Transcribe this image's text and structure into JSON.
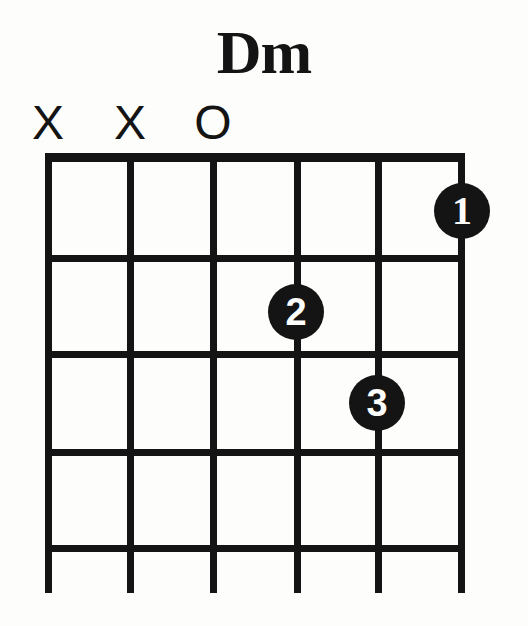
{
  "diagram": {
    "title": "Dm",
    "instrument": "guitar",
    "type": "chord-diagram",
    "accent_color": "#141414",
    "background_color": "#fdfdfc",
    "fret_count": 4,
    "string_count": 6,
    "starting_fret": 1,
    "string_markers": [
      {
        "string": 1,
        "symbol": "X",
        "meaning": "muted",
        "x": 48
      },
      {
        "string": 2,
        "symbol": "X",
        "meaning": "muted",
        "x": 130
      },
      {
        "string": 3,
        "symbol": "O",
        "meaning": "open",
        "x": 213
      }
    ],
    "strings": [
      {
        "index": 1,
        "x": 48
      },
      {
        "index": 2,
        "x": 130
      },
      {
        "index": 3,
        "x": 213
      },
      {
        "index": 4,
        "x": 297
      },
      {
        "index": 5,
        "x": 378
      },
      {
        "index": 6,
        "x": 462
      }
    ],
    "nut": {
      "x": 45,
      "y": 153,
      "width": 420,
      "height": 9
    },
    "fret_lines": [
      {
        "fret": 1,
        "y": 258
      },
      {
        "fret": 2,
        "y": 354
      },
      {
        "fret": 3,
        "y": 452
      },
      {
        "fret": 4,
        "y": 548
      }
    ],
    "string_extent": {
      "top": 153,
      "bottom": 593
    },
    "finger_dots": [
      {
        "label": "1",
        "string": 6,
        "fret": 1,
        "x": 462,
        "y": 211
      },
      {
        "label": "2",
        "string": 4,
        "fret": 2,
        "x": 296,
        "y": 312
      },
      {
        "label": "3",
        "string": 5,
        "fret": 3,
        "x": 377,
        "y": 403
      }
    ]
  }
}
